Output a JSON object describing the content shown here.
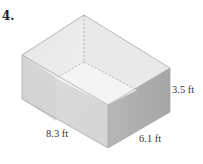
{
  "problem": {
    "number": "4."
  },
  "figure": {
    "shape": "rectangular-prism",
    "dimensions": {
      "length": "8.3 ft",
      "width": "6.1 ft",
      "height": "3.5 ft"
    },
    "colors": {
      "top_face": "#e4e4e4",
      "left_face": "#c9c9c9",
      "front_face": "#d7d7d7",
      "right_face": "#b3b3b3",
      "inner_floor": "#f2f2f2",
      "edge": "#9a9a9a"
    }
  }
}
